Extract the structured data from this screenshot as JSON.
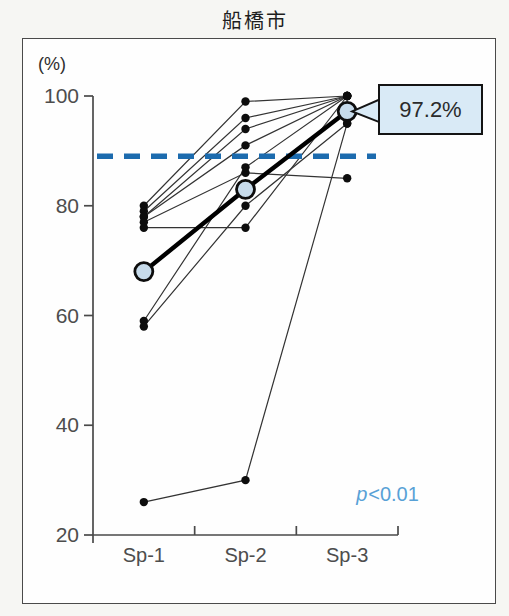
{
  "title": "船橋市",
  "chart": {
    "y_unit_label": "(%)",
    "annotation_label": "97.2%",
    "stats": {
      "symbol": "p",
      "rest": "<0.01",
      "text": "p<0.01"
    }
  },
  "chart_data": {
    "type": "line",
    "title": "船橋市",
    "subtitle": "",
    "categories": [
      "Sp-1",
      "Sp-2",
      "Sp-3"
    ],
    "xlabel": "",
    "ylabel": "(%)",
    "ylim": [
      20,
      100
    ],
    "yticks": [
      20,
      40,
      60,
      80,
      100
    ],
    "grid": false,
    "legend": "none",
    "series": [
      {
        "name": "individual-1",
        "values": [
          80,
          99,
          100
        ]
      },
      {
        "name": "individual-2",
        "values": [
          79,
          96,
          100
        ]
      },
      {
        "name": "individual-3",
        "values": [
          78,
          94,
          100
        ]
      },
      {
        "name": "individual-4",
        "values": [
          78,
          91,
          100
        ]
      },
      {
        "name": "individual-5",
        "values": [
          77,
          86,
          85
        ]
      },
      {
        "name": "individual-6",
        "values": [
          76,
          76,
          100
        ]
      },
      {
        "name": "individual-7",
        "values": [
          59,
          87,
          100
        ]
      },
      {
        "name": "individual-8",
        "values": [
          58,
          80,
          95
        ]
      },
      {
        "name": "individual-9",
        "values": [
          26,
          30,
          95
        ]
      }
    ],
    "mean_series": {
      "name": "mean",
      "values": [
        68,
        83,
        97.2
      ]
    },
    "reference_line": {
      "value": 89,
      "style": "dashed",
      "color": "#1c6bae"
    },
    "annotation": {
      "text": "97.2%",
      "target_series": "mean",
      "target_category": "Sp-3"
    },
    "stats_text": "p<0.01",
    "colors": {
      "individual_line": "#333333",
      "individual_dot": "#0d0d0d",
      "mean_line": "#000000",
      "mean_marker_fill": "#c7dbeb",
      "mean_marker_stroke": "#0d0d0d",
      "reference_dashed": "#1c6bae",
      "p_text": "#58a1d6",
      "callout_fill": "#d9eaf6",
      "callout_border": "#141414",
      "axis": "#4a4a4a",
      "tick_label": "#4d4d4d"
    }
  }
}
